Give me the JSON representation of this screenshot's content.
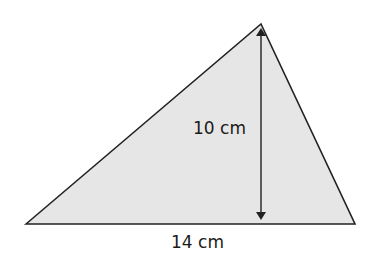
{
  "diagram": {
    "type": "triangle",
    "fill_color": "#e6e6e6",
    "stroke_color": "#222222",
    "vertices": {
      "left": [
        26,
        224
      ],
      "apex": [
        261,
        24
      ],
      "right": [
        355,
        224
      ]
    },
    "height_label": "10 cm",
    "base_label": "14 cm"
  }
}
